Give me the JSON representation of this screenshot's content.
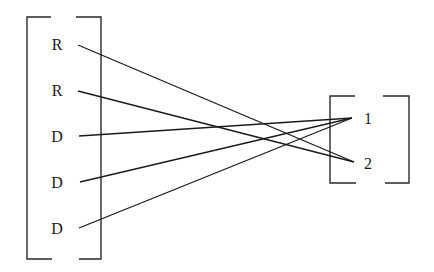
{
  "diagram": {
    "type": "bipartite-mapping",
    "left_set": {
      "items": [
        {
          "label": "R",
          "x": 57,
          "y": 45,
          "anchor_x": 78,
          "anchor_y": 45
        },
        {
          "label": "R",
          "x": 57,
          "y": 91,
          "anchor_x": 78,
          "anchor_y": 91
        },
        {
          "label": "D",
          "x": 57,
          "y": 136,
          "anchor_x": 79,
          "anchor_y": 136
        },
        {
          "label": "D",
          "x": 57,
          "y": 182,
          "anchor_x": 80,
          "anchor_y": 182
        },
        {
          "label": "D",
          "x": 57,
          "y": 228,
          "anchor_x": 79,
          "anchor_y": 228
        }
      ]
    },
    "right_set": {
      "items": [
        {
          "label": "1",
          "x": 368,
          "y": 118,
          "anchor_x": 352,
          "anchor_y": 118
        },
        {
          "label": "2",
          "x": 368,
          "y": 163,
          "anchor_x": 354,
          "anchor_y": 162
        }
      ]
    },
    "edges": [
      {
        "from": 0,
        "to": 1
      },
      {
        "from": 1,
        "to": 1
      },
      {
        "from": 2,
        "to": 0
      },
      {
        "from": 3,
        "to": 0
      },
      {
        "from": 4,
        "to": 0
      }
    ],
    "colors": {
      "ink": "#1a1a1a",
      "background": "#ffffff"
    }
  }
}
